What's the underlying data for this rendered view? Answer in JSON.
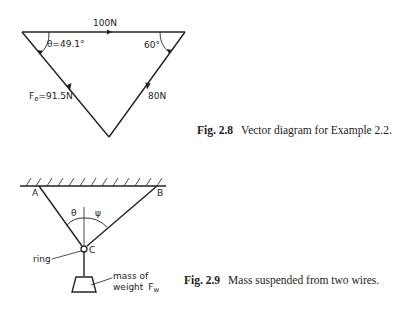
{
  "figure_2_8": {
    "caption_number": "Fig. 2.8",
    "caption_text": "Vector diagram for Example 2.2.",
    "labels": {
      "top_force": "100N",
      "left_angle": "θ=49.1°",
      "right_angle": "60°",
      "right_force": "80N",
      "left_force_symbol": "F",
      "left_force_sub": "e",
      "left_force_value": "=91.5N"
    }
  },
  "figure_2_9": {
    "caption_number": "Fig. 2.9",
    "caption_text": "Mass suspended from two wires.",
    "labels": {
      "point_a": "A",
      "point_b": "B",
      "point_c": "C",
      "angle_theta": "θ",
      "angle_psi": "ψ",
      "ring": "ring",
      "mass_line1": "mass of",
      "mass_line2": "weight",
      "weight_symbol": "F",
      "weight_sub": "w"
    }
  },
  "colors": {
    "ink": "#222222",
    "background": "#ffffff"
  }
}
